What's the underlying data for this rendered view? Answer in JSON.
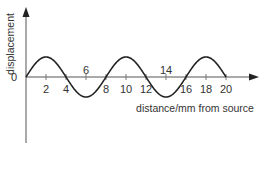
{
  "chart_data": {
    "type": "line",
    "title": "",
    "xlabel": "distance/mm from source",
    "ylabel": "displacement",
    "origin_label": "0",
    "x_ticks_below": [
      "2",
      "4",
      "8",
      "10",
      "12",
      "16",
      "18",
      "20"
    ],
    "x_ticks_above": [
      "6",
      "14"
    ],
    "x_tick_values": [
      2,
      4,
      6,
      8,
      10,
      12,
      14,
      16,
      18,
      20
    ],
    "xlim": [
      0,
      20
    ],
    "ylim": [
      -1,
      1
    ],
    "grid": false,
    "legend": null,
    "series": [
      {
        "name": "wave",
        "description": "sinusoidal displacement, wavelength 8 mm, amplitude 1 (arbitrary units)",
        "wavelength_mm": 8,
        "amplitude": 1,
        "x": [
          0,
          1,
          2,
          3,
          4,
          5,
          6,
          7,
          8,
          9,
          10,
          11,
          12,
          13,
          14,
          15,
          16,
          17,
          18,
          19,
          20
        ],
        "y": [
          0,
          0.71,
          1,
          0.71,
          0,
          -0.71,
          -1,
          -0.71,
          0,
          0.71,
          1,
          0.71,
          0,
          -0.71,
          -1,
          -0.71,
          0,
          0.71,
          1,
          0.71,
          0
        ]
      }
    ]
  },
  "colors": {
    "axis": "#333333",
    "curve": "#222222",
    "text": "#333333"
  }
}
